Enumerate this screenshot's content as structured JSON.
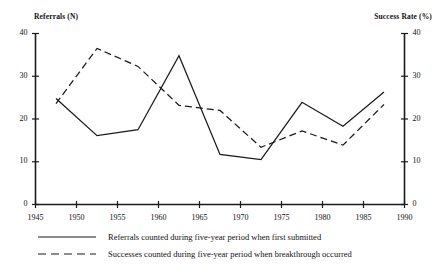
{
  "chart_data": {
    "type": "line",
    "title": "",
    "xlabel": "",
    "ylabel": "Referrals  (N)",
    "y2label": "Success Rate (%)",
    "xlim": [
      1945,
      1990
    ],
    "ylim": [
      0,
      40
    ],
    "y2lim": [
      0,
      40
    ],
    "grid": false,
    "legend_position": "bottom-left",
    "xticks": [
      1945,
      1950,
      1955,
      1960,
      1965,
      1970,
      1975,
      1980,
      1985,
      1990
    ],
    "yticks": [
      0,
      10,
      20,
      30,
      40
    ],
    "y2ticks": [
      0,
      10,
      20,
      30,
      40
    ],
    "x": [
      1947.5,
      1952.5,
      1957.5,
      1962.5,
      1967.5,
      1972.5,
      1977.5,
      1982.5,
      1987.5
    ],
    "series": [
      {
        "name": "Referrals counted during five-year period when first submitted",
        "style": "solid",
        "axis": "left",
        "values": [
          24.8,
          16.1,
          17.5,
          34.8,
          11.7,
          10.5,
          23.9,
          18.3,
          26.3
        ]
      },
      {
        "name": "Successes counted during five-year period when breakthrough occurred",
        "style": "dashed",
        "axis": "right",
        "values": [
          23.6,
          36.5,
          32.3,
          23.2,
          22.0,
          13.4,
          17.2,
          13.9,
          23.4
        ]
      }
    ]
  },
  "axes": {
    "left_title": "Referrals  (N)",
    "right_title": "Success Rate (%)",
    "y_tick_labels": [
      "40",
      "30",
      "20",
      "10",
      "0"
    ],
    "y2_tick_labels": [
      "40",
      "30",
      "20",
      "10",
      "0"
    ],
    "x_tick_labels": [
      "1945",
      "1950",
      "1955",
      "1960",
      "1965",
      "1970",
      "1975",
      "1980",
      "1985",
      "1990"
    ]
  },
  "legend": {
    "items": [
      {
        "label": "Referrals counted during five-year period when first submitted",
        "style": "solid"
      },
      {
        "label": "Successes counted during five-year period when breakthrough occurred",
        "style": "dashed"
      }
    ]
  },
  "colors": {
    "line": "#1a1a1a",
    "axis": "#1a1a1a",
    "background": "#ffffff"
  }
}
